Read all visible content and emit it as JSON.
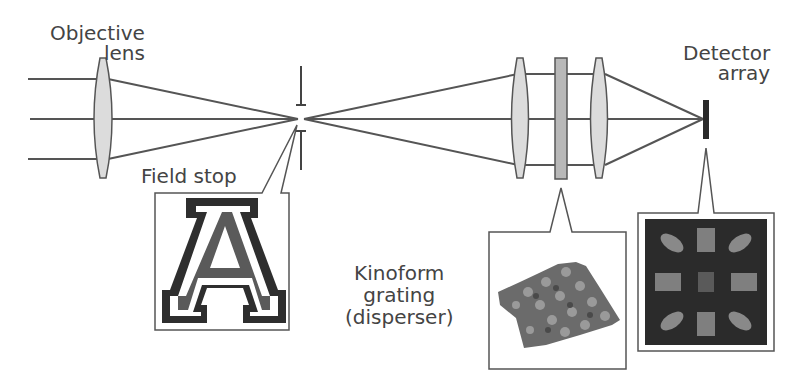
{
  "diagram": {
    "labels": {
      "objective_lens": [
        "Objective",
        "lens"
      ],
      "field_stop": "Field stop",
      "detector_array": [
        "Detector",
        "array"
      ],
      "kinoform": [
        "Kinoform",
        "grating",
        "(disperser)"
      ]
    },
    "components": [
      {
        "id": "objective-lens",
        "type": "lens",
        "x": 103
      },
      {
        "id": "field-stop",
        "type": "aperture",
        "x": 301
      },
      {
        "id": "collimating-lens",
        "type": "lens",
        "x": 520
      },
      {
        "id": "kinoform-grating",
        "type": "grating",
        "x": 561
      },
      {
        "id": "imaging-lens",
        "type": "lens",
        "x": 599
      },
      {
        "id": "detector-array",
        "type": "detector",
        "x": 706
      }
    ],
    "insets": [
      {
        "id": "field-stop-inset",
        "content": "letter A logo"
      },
      {
        "id": "kinoform-inset",
        "content": "3D surface of kinoform grating"
      },
      {
        "id": "detector-inset",
        "content": "dispersed image pattern"
      }
    ],
    "colors": {
      "line": "#555555",
      "lens_fill": "#dcdcdc",
      "grating_fill": "#b8b8b8",
      "detector": "#2a2a2a",
      "inset_dark": "#2b2b2b"
    }
  }
}
